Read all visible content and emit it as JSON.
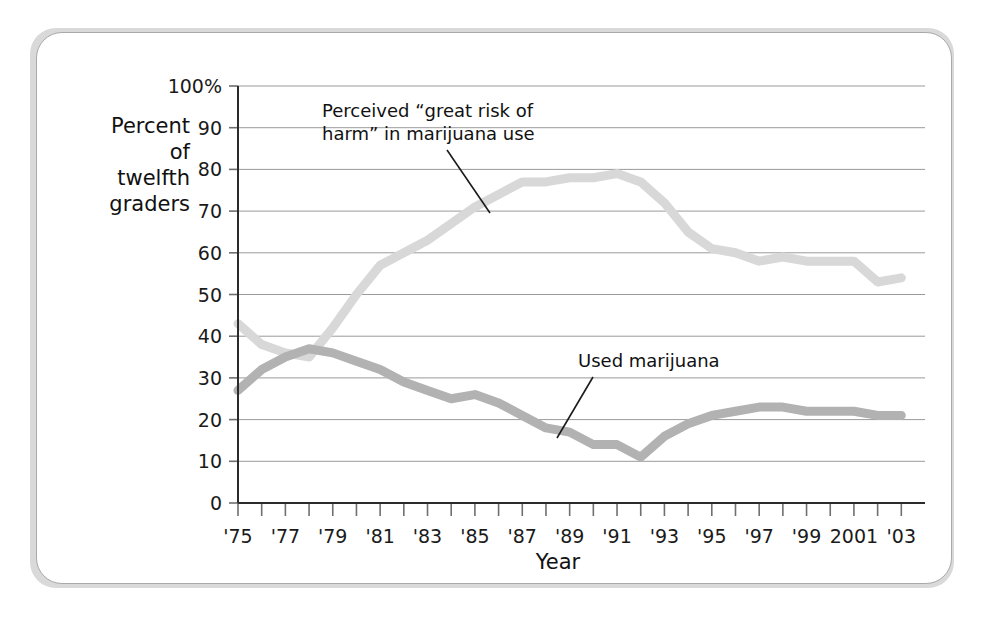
{
  "figure": {
    "background_color": "#ffffff",
    "card_border_color": "#a9a9a9",
    "shadow_color": "#d9d9d9"
  },
  "chart_data": {
    "type": "line",
    "title": "",
    "xlabel": "Year",
    "ylabel": "Percent of twelfth graders",
    "ylabel_lines": [
      "Percent",
      "of",
      "twelfth",
      "graders"
    ],
    "xlim": [
      1975,
      2004
    ],
    "ylim": [
      0,
      100
    ],
    "grid": true,
    "legend_position": "inline-annotations",
    "ytick_labels": [
      "100%",
      "90",
      "80",
      "70",
      "60",
      "50",
      "40",
      "30",
      "20",
      "10",
      "0"
    ],
    "ytick_values": [
      100,
      90,
      80,
      70,
      60,
      50,
      40,
      30,
      20,
      10,
      0
    ],
    "x": [
      1975,
      1976,
      1977,
      1978,
      1979,
      1980,
      1981,
      1982,
      1983,
      1984,
      1985,
      1986,
      1987,
      1988,
      1989,
      1990,
      1991,
      1992,
      1993,
      1994,
      1995,
      1996,
      1997,
      1998,
      1999,
      2000,
      2001,
      2002,
      2003
    ],
    "xtick_labels": [
      "'75",
      "",
      "'77",
      "",
      "'79",
      "",
      "'81",
      "",
      "'83",
      "",
      "'85",
      "",
      "'87",
      "",
      "'89",
      "",
      "'91",
      "",
      "'93",
      "",
      "'95",
      "",
      "'97",
      "",
      "'99",
      "",
      "2001",
      "",
      "'03"
    ],
    "series": [
      {
        "name": "Perceived “great risk of harm” in marijuana use",
        "color": "#d8d8d8",
        "stroke_width": 9,
        "values": [
          43,
          38,
          36,
          35,
          42,
          50,
          57,
          60,
          63,
          67,
          71,
          74,
          77,
          77,
          78,
          78,
          79,
          77,
          72,
          65,
          61,
          60,
          58,
          59,
          58,
          58,
          58,
          53,
          54
        ]
      },
      {
        "name": "Used marijuana",
        "color": "#b2b2b2",
        "stroke_width": 9,
        "values": [
          27,
          32,
          35,
          37,
          36,
          34,
          32,
          29,
          27,
          25,
          26,
          24,
          21,
          18,
          17,
          14,
          14,
          11,
          16,
          19,
          21,
          22,
          23,
          23,
          22,
          22,
          22,
          21,
          21
        ]
      }
    ],
    "annotations": [
      {
        "name": "perceived-risk-annotation",
        "text_lines": [
          "Perceived “great risk of",
          "harm” in marijuana use"
        ],
        "text_x": 322,
        "text_y": 117,
        "leader_from_x": 447,
        "leader_from_y": 150,
        "leader_to_x": 490,
        "leader_to_y": 213
      },
      {
        "name": "used-marijuana-annotation",
        "text_lines": [
          "Used marijuana"
        ],
        "text_x": 578,
        "text_y": 367,
        "leader_from_x": 593,
        "leader_from_y": 377,
        "leader_to_x": 557,
        "leader_to_y": 438
      }
    ]
  }
}
